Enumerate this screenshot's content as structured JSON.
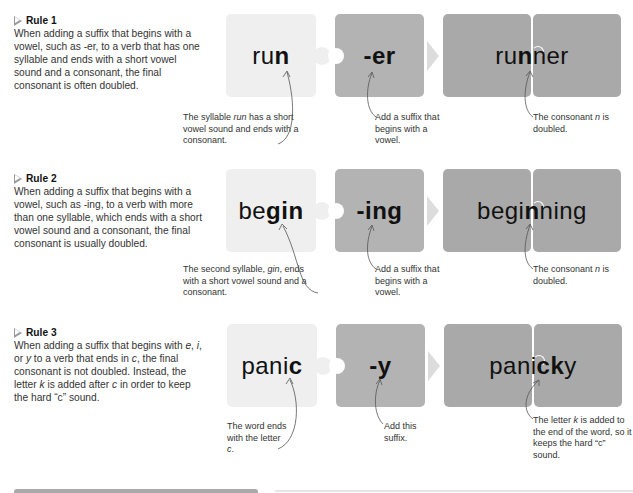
{
  "rules": [
    {
      "title": "Rule 1",
      "description": "When adding a suffix that begins with a vowel, such as -er, to a verb that has one syllable and ends with a short vowel sound and a consonant, the final consonant is often doubled.",
      "base_word": {
        "plain": "ru",
        "bold": "n"
      },
      "suffix": "-er",
      "result_word": {
        "pre": "ru",
        "bold": "n",
        "post": "ner"
      },
      "base_note": {
        "pre": "The syllable ",
        "italic": "run",
        "post": " has a short vowel sound and ends with a consonant."
      },
      "suffix_note": "Add a suffix that begins with a vowel.",
      "result_note": {
        "pre": "The consonant ",
        "italic": "n",
        "post": " is doubled."
      }
    },
    {
      "title": "Rule 2",
      "description": "When adding a suffix that begins with a vowel, such as -ing, to a verb with more than one syllable, which ends with a short vowel sound and a consonant, the final consonant is usually doubled.",
      "base_word": {
        "plain": "be",
        "bold": "gin"
      },
      "suffix": "-ing",
      "result_word": {
        "pre": "begi",
        "bold": "n",
        "post": "ning"
      },
      "base_note": {
        "pre": "The second syllable, ",
        "italic": "gin",
        "post": ", ends with a short vowel sound and a consonant."
      },
      "suffix_note": "Add a suffix that begins with a vowel.",
      "result_note": {
        "pre": "The consonant ",
        "italic": "n",
        "post": " is doubled."
      }
    },
    {
      "title": "Rule 3",
      "description_parts": [
        "When adding a suffix that begins with ",
        "e",
        ", ",
        "i",
        ", or ",
        "y",
        " to a verb that ends in ",
        "c",
        ", the final consonant is not doubled. Instead, the letter ",
        "k",
        " is added after ",
        "c",
        " in order to keep the hard “c” sound."
      ],
      "base_word": {
        "plain": "pani",
        "bold": "c"
      },
      "suffix": "-y",
      "result_word": {
        "pre": "pani",
        "bold": "ck",
        "post": "y"
      },
      "base_note": {
        "pre": "The word ends with the letter ",
        "italic": "c",
        "post": "."
      },
      "suffix_note": "Add this suffix.",
      "result_note": {
        "pre": "The letter ",
        "italic": "k",
        "post": " is added to the end of the word, so it keeps the hard “c” sound."
      }
    }
  ],
  "colors": {
    "base_piece": "#efefef",
    "suffix_piece": "#b3b3b3",
    "result_piece": "#a9a9a9",
    "arrow": "#dcdcdc"
  }
}
